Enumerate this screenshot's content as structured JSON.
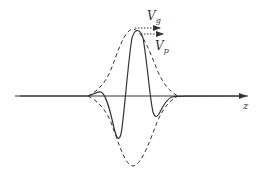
{
  "diagram": {
    "axis_label": "z",
    "labels": {
      "group_velocity": "V",
      "group_velocity_sub": "g",
      "phase_velocity": "V",
      "phase_velocity_sub": "p"
    },
    "elements": [
      {
        "name": "envelope",
        "style": "dashed"
      },
      {
        "name": "carrier-wave",
        "style": "solid"
      },
      {
        "name": "z-axis",
        "style": "solid-arrow"
      },
      {
        "name": "group-velocity-arrow",
        "style": "dotted-arrow"
      },
      {
        "name": "phase-velocity-arrow",
        "style": "dotted-arrow"
      }
    ],
    "colors": {
      "line": "#333333",
      "background": "#ffffff"
    }
  }
}
